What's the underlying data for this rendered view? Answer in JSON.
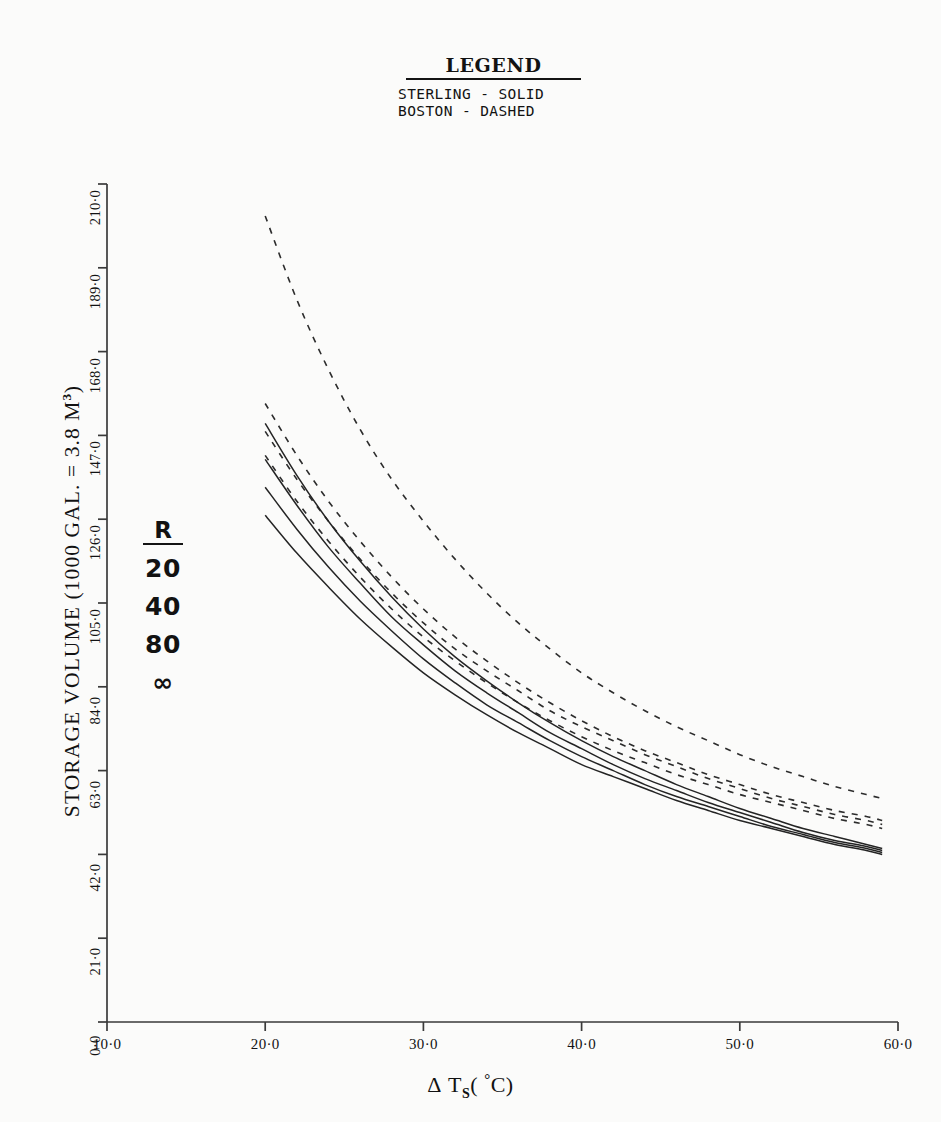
{
  "legend": {
    "title": "LEGEND",
    "entries": [
      "STERLING - SOLID",
      "BOSTON - DASHED"
    ]
  },
  "annotation": {
    "header": "R",
    "values": [
      "20",
      "40",
      "80",
      "∞"
    ]
  },
  "axes": {
    "y_label_main": "STORAGE VOLUME (1000 GAL. = 3.8 M",
    "y_label_unit_sup": "3",
    "y_label_tail": ")",
    "x_label_delta": "Δ",
    "x_label_t": "T",
    "x_label_sub": "S",
    "x_label_open": "(",
    "x_label_deg": "°",
    "x_label_c": "C)",
    "y_ticks": [
      "0·0",
      "21·0",
      "42·0",
      "63·0",
      "84·0",
      "105·0",
      "126·0",
      "147·0",
      "168·0",
      "189·0",
      "210·0"
    ],
    "x_ticks": [
      "10·0",
      "20·0",
      "30·0",
      "40·0",
      "50·0",
      "60·0"
    ]
  },
  "chart_data": {
    "type": "line",
    "title": "",
    "xlabel": "Δ T_S ( °C)",
    "ylabel": "STORAGE VOLUME (1000 GAL. = 3.8 M³)",
    "xlim": [
      10.0,
      60.0
    ],
    "ylim": [
      0.0,
      210.0
    ],
    "xticks": [
      10.0,
      20.0,
      30.0,
      40.0,
      50.0,
      60.0
    ],
    "yticks": [
      0.0,
      21.0,
      42.0,
      63.0,
      84.0,
      105.0,
      126.0,
      147.0,
      168.0,
      189.0,
      210.0
    ],
    "grid": false,
    "legend_position": "top-center",
    "annotation_r_values": [
      20,
      40,
      80,
      "∞"
    ],
    "x": [
      20,
      22,
      24,
      26,
      28,
      30,
      32,
      34,
      36,
      38,
      40,
      42,
      44,
      46,
      48,
      50,
      52,
      54,
      56,
      58,
      59
    ],
    "series": [
      {
        "name": "BOSTON R=20",
        "style": "dashed",
        "values": [
          202.0,
          181.0,
          163.5,
          148.5,
          136.0,
          125.5,
          116.0,
          107.5,
          100.0,
          93.5,
          87.5,
          82.5,
          78.0,
          74.0,
          70.5,
          67.0,
          64.0,
          61.5,
          59.0,
          57.0,
          56.0
        ]
      },
      {
        "name": "BOSTON R=40",
        "style": "dashed",
        "values": [
          155.0,
          142.0,
          130.5,
          120.5,
          111.5,
          103.5,
          96.5,
          90.5,
          85.0,
          80.0,
          75.5,
          71.5,
          68.0,
          65.0,
          62.0,
          59.5,
          57.0,
          55.0,
          53.0,
          51.5,
          50.5
        ]
      },
      {
        "name": "BOSTON R=80",
        "style": "dashed",
        "values": [
          148.0,
          136.0,
          125.5,
          116.0,
          107.5,
          100.0,
          93.5,
          88.0,
          83.0,
          78.0,
          74.0,
          70.5,
          67.0,
          64.0,
          61.0,
          58.5,
          56.0,
          54.0,
          52.0,
          50.5,
          49.5
        ]
      },
      {
        "name": "BOSTON R=inf",
        "style": "dashed",
        "values": [
          142.0,
          130.5,
          120.5,
          111.5,
          103.5,
          96.5,
          90.5,
          85.0,
          80.0,
          75.5,
          71.5,
          68.0,
          65.0,
          62.0,
          59.5,
          57.0,
          55.0,
          53.0,
          51.0,
          49.5,
          48.5
        ]
      },
      {
        "name": "STERLING R=20",
        "style": "solid",
        "values": [
          150.0,
          137.0,
          125.5,
          115.5,
          106.5,
          98.5,
          91.5,
          85.5,
          80.0,
          75.0,
          70.5,
          66.5,
          63.0,
          59.5,
          56.5,
          53.5,
          51.0,
          48.5,
          46.5,
          44.5,
          43.5
        ]
      },
      {
        "name": "STERLING R=40",
        "style": "solid",
        "values": [
          141.0,
          129.5,
          119.0,
          110.0,
          101.5,
          94.5,
          88.0,
          82.5,
          77.5,
          72.5,
          68.5,
          64.5,
          61.0,
          58.0,
          55.0,
          52.5,
          50.0,
          47.5,
          45.5,
          44.0,
          43.0
        ]
      },
      {
        "name": "STERLING R=80",
        "style": "solid",
        "values": [
          134.0,
          123.5,
          114.0,
          105.5,
          98.0,
          91.0,
          85.0,
          79.5,
          75.0,
          70.5,
          66.5,
          63.0,
          59.5,
          56.5,
          54.0,
          51.5,
          49.0,
          47.0,
          45.0,
          43.5,
          42.5
        ]
      },
      {
        "name": "STERLING R=inf",
        "style": "solid",
        "values": [
          127.0,
          117.5,
          109.0,
          101.0,
          94.0,
          87.5,
          82.0,
          77.0,
          72.5,
          68.5,
          64.5,
          61.5,
          58.5,
          55.5,
          53.0,
          50.5,
          48.5,
          46.5,
          44.5,
          43.0,
          42.0
        ]
      }
    ]
  }
}
